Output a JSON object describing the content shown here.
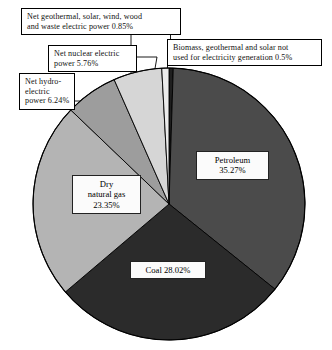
{
  "chart_data": {
    "type": "pie",
    "title": "",
    "subtitle": "",
    "xlabel": "",
    "ylabel": "",
    "legend_position": "callout-labels",
    "grid": false,
    "units": "percent",
    "total": 100,
    "categories": [
      "Biomass, geothermal and solar not used for electricity generation",
      "Petroleum",
      "Coal",
      "Dry natural gas",
      "Net hydro-electric power",
      "Net nuclear electric power",
      "Net geothermal, solar, wind, wood and waste electric power"
    ],
    "values": [
      0.5,
      35.27,
      28.02,
      23.35,
      6.24,
      5.76,
      0.85
    ],
    "slices": [
      {
        "name": "Biomass, geothermal and solar not used for electricity generation",
        "value": 0.5,
        "value_label": "0.5%",
        "color": "#1f1f1f",
        "label_style": "callout",
        "label_text": "Biomass, geothermal and solar not used for electricity generation 0.5%"
      },
      {
        "name": "Petroleum",
        "value": 35.27,
        "value_label": "35.27%",
        "color": "#4b4b4b",
        "label_style": "inside",
        "label_line1": "Petroleum",
        "label_line2": "35.27%"
      },
      {
        "name": "Coal",
        "value": 28.02,
        "value_label": "28.02%",
        "color": "#2b2b2b",
        "label_style": "inside",
        "label_line1": "Coal 28.02%",
        "label_line2": ""
      },
      {
        "name": "Dry natural gas",
        "value": 23.35,
        "value_label": "23.35%",
        "color": "#b4b4b4",
        "label_style": "inside",
        "label_line1": "Dry",
        "label_line2": "natural gas",
        "label_line3": "23.35%"
      },
      {
        "name": "Net hydro-electric power",
        "value": 6.24,
        "value_label": "6.24%",
        "color": "#9d9d9d",
        "label_style": "callout",
        "label_text": "Net hydro-electric power 6.24%"
      },
      {
        "name": "Net nuclear electric power",
        "value": 5.76,
        "value_label": "5.76%",
        "color": "#d6d6d6",
        "label_style": "callout",
        "label_text": "Net nuclear electric power 5.76%"
      },
      {
        "name": "Net geothermal, solar, wind, wood and waste electric power",
        "value": 0.85,
        "value_label": "0.85%",
        "color": "#ececec",
        "label_style": "callout",
        "label_text": "Net geothermal, solar, wind, wood and waste electric power 0.85%"
      }
    ]
  },
  "callouts": {
    "geothermal": {
      "line1": "Net geothermal, solar, wind, wood",
      "line2": "and waste electric power 0.85%"
    },
    "nuclear": {
      "line1": "Net nuclear electric",
      "line2": "power 5.76%"
    },
    "hydro": {
      "line1": "Net hydro-",
      "line2": "electric",
      "line3": "power 6.24%"
    },
    "biomass": {
      "line1": "Biomass, geothermal and solar not",
      "line2": "used for electricity generation 0.5%"
    }
  },
  "inside_labels": {
    "petroleum": {
      "line1": "Petroleum",
      "line2": "35.27%"
    },
    "natural_gas": {
      "line1": "Dry",
      "line2": "natural gas",
      "line3": "23.35%"
    },
    "coal": {
      "line1": "Coal 28.02%"
    }
  },
  "style": {
    "background": "#ffffff",
    "outline": "#000000",
    "petroleum_color": "#4b4b4b",
    "coal_color": "#2b2b2b",
    "gas_color": "#b4b4b4",
    "hydro_color": "#9d9d9d",
    "nuclear_color": "#d6d6d6",
    "geothermal_color": "#ececec",
    "biomass_color": "#1f1f1f"
  }
}
